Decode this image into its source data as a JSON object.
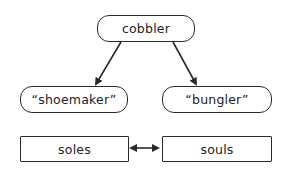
{
  "diagram": {
    "type": "hierarchy",
    "nodes": {
      "root": {
        "label": "cobbler",
        "shape": "rounded"
      },
      "left": {
        "label": "“shoemaker”",
        "shape": "rounded"
      },
      "right": {
        "label": "“bungler”",
        "shape": "rounded"
      },
      "bottom_left": {
        "label": "soles",
        "shape": "rectangle"
      },
      "bottom_right": {
        "label": "souls",
        "shape": "rectangle"
      }
    },
    "edges": [
      {
        "from": "cobbler",
        "to": "“shoemaker”",
        "type": "arrow"
      },
      {
        "from": "cobbler",
        "to": "“bungler”",
        "type": "arrow"
      },
      {
        "from": "soles",
        "to": "souls",
        "type": "bidirectional-arrow"
      }
    ],
    "colors": {
      "stroke": "#2a2a2a",
      "background": "#ffffff",
      "text": "#222222"
    }
  }
}
